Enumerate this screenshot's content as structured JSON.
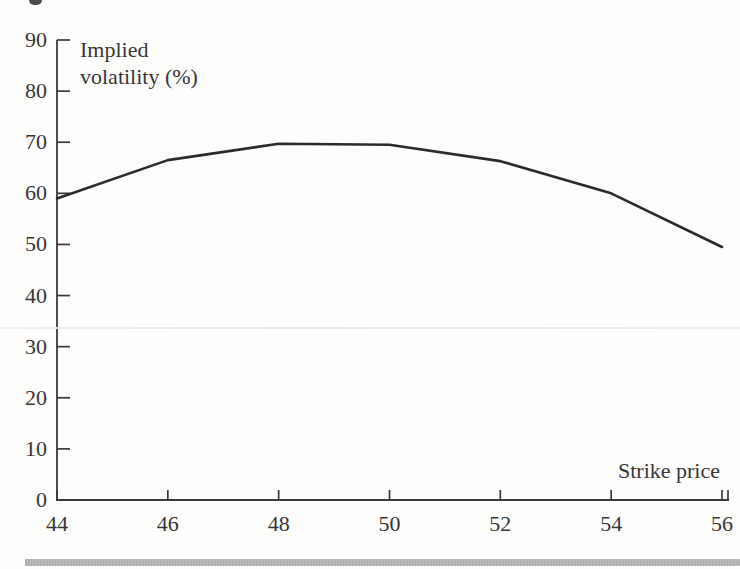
{
  "page": {
    "background": "#fdfdfc",
    "bottom_rule_color": "#b0b0b0"
  },
  "figure": {
    "ylabel_line1": "Implied",
    "ylabel_line2": "volatility (%)",
    "xlabel": "Strike price"
  },
  "chart_data": {
    "type": "line",
    "x": [
      44,
      46,
      48,
      50,
      52,
      54,
      56
    ],
    "values": [
      59,
      66.5,
      69.7,
      69.5,
      66.3,
      60,
      49.5
    ],
    "series_name": "Implied volatility",
    "xlabel": "Strike price",
    "ylabel": "Implied volatility (%)",
    "xlim": [
      44,
      56
    ],
    "ylim": [
      0,
      90
    ],
    "xticks": [
      44,
      46,
      48,
      50,
      52,
      54,
      56
    ],
    "yticks": [
      0,
      10,
      20,
      30,
      40,
      50,
      60,
      70,
      80,
      90
    ],
    "grid": false,
    "legend": "none",
    "line_color": "#2b2b2b",
    "axis_color": "#3a3a3a"
  }
}
